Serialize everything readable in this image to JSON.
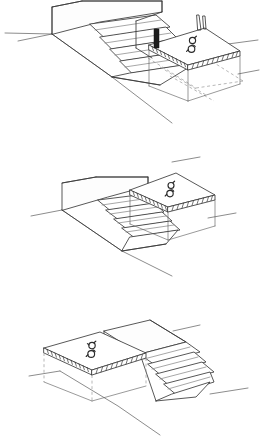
{
  "document": {
    "title": "Wheelchair Platform Lift — Sequence Sketch",
    "medium": "hand-drawn pen line drawing",
    "background_color": "#ffffff",
    "line_color": "#3a3a3a",
    "hidden_line_color": "#9a9a9a",
    "accent_dark": "#1d1d1d",
    "panel_count": 3,
    "visible_text": "",
    "labels": []
  },
  "panels": [
    {
      "id": "panel-top",
      "name": "lift-platform-lowered-at-grade",
      "caption": "",
      "view": "axonometric from upper left",
      "elements": {
        "stair": {
          "name": "concrete-stair-flight",
          "tread_count": 6,
          "direction": "descending toward lower left"
        },
        "landing": {
          "name": "upper-landing-slab",
          "shape": "rectangular block"
        },
        "platform": {
          "name": "lift-platform",
          "position": "lowered to lower grade level",
          "edge_treatment": "hatched slab edge",
          "symbol": "wheelchair-symbol"
        },
        "guard_post": {
          "name": "guard-post",
          "count": 2,
          "fill": "#1d1d1d"
        },
        "pit_outline": {
          "name": "lift-pit-dashed-outline",
          "style": "dashed hidden line"
        },
        "ground_lines": {
          "name": "ground-plane-lines",
          "count": 3
        }
      }
    },
    {
      "id": "panel-middle",
      "name": "lift-platform-raised-at-landing",
      "caption": "",
      "view": "axonometric from upper left",
      "elements": {
        "stair": {
          "name": "concrete-stair-flight",
          "tread_count": 6,
          "direction": "descending toward lower left"
        },
        "landing": {
          "name": "upper-landing-slab",
          "shape": "rectangular block"
        },
        "platform": {
          "name": "lift-platform",
          "position": "raised flush with upper landing",
          "edge_treatment": "hatched slab edge",
          "symbol": "wheelchair-symbol"
        },
        "support_legs": {
          "name": "platform-support-legs",
          "count": 3,
          "style": "thin vertical lines"
        },
        "ground_lines": {
          "name": "ground-plane-lines",
          "count": 3
        }
      }
    },
    {
      "id": "panel-bottom",
      "name": "lift-platform-mirrored-left-side",
      "caption": "",
      "view": "axonometric, mirrored — stair descends to the right",
      "elements": {
        "stair": {
          "name": "concrete-stair-flight",
          "tread_count": 5,
          "direction": "descending toward lower right"
        },
        "landing": {
          "name": "upper-landing-slab",
          "shape": "rectangular block"
        },
        "platform": {
          "name": "lift-platform",
          "position": "raised flush with upper landing, left of stair",
          "edge_treatment": "hatched slab edge",
          "symbol": "wheelchair-symbol"
        },
        "support_legs": {
          "name": "platform-support-legs",
          "count": 3,
          "style": "thin dashed vertical lines"
        },
        "ground_lines": {
          "name": "ground-plane-lines",
          "count": 3
        }
      }
    }
  ]
}
